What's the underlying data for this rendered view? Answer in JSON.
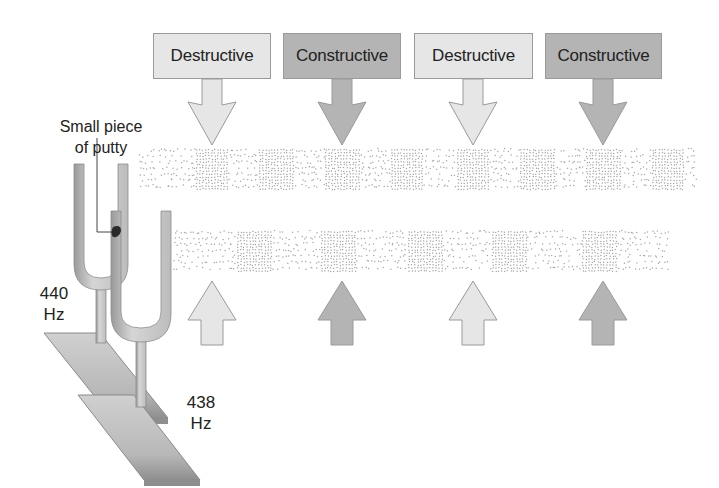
{
  "labels": {
    "putty": [
      "Small piece",
      "of putty"
    ],
    "fork_a": [
      "440",
      "Hz"
    ],
    "fork_b": [
      "438",
      "Hz"
    ]
  },
  "interference_labels": [
    {
      "text": "Destructive",
      "type": "destructive",
      "x": 153,
      "w": 118,
      "cx": 212
    },
    {
      "text": "Constructive",
      "type": "constructive",
      "x": 283,
      "w": 118,
      "cx": 342
    },
    {
      "text": "Destructive",
      "type": "destructive",
      "x": 414,
      "w": 119,
      "cx": 473
    },
    {
      "text": "Constructive",
      "type": "constructive",
      "x": 545,
      "w": 117,
      "cx": 603
    }
  ],
  "colors": {
    "destructive_fill": "#e6e6e6",
    "constructive_fill": "#b4b4b4",
    "outline": "#9a9a9a",
    "dots": "#a8a8a8",
    "fork": "#c8c8c8",
    "fork_dark": "#8e8e8e",
    "base": "#bdbdbd"
  },
  "bands": {
    "top": {
      "x": 140,
      "y": 150,
      "w": 557,
      "h": 40,
      "dense_centers": [
        212,
        277,
        342,
        407,
        473,
        538,
        603,
        668
      ],
      "dense_w": 34
    },
    "bottom": {
      "x": 175,
      "y": 232,
      "w": 493,
      "h": 40,
      "dense_centers": [
        255,
        338,
        425,
        510,
        600
      ],
      "dense_w": 36
    }
  },
  "up_arrows": [
    {
      "cx": 212,
      "type": "destructive"
    },
    {
      "cx": 342,
      "type": "constructive"
    },
    {
      "cx": 473,
      "type": "destructive"
    },
    {
      "cx": 603,
      "type": "constructive"
    }
  ]
}
